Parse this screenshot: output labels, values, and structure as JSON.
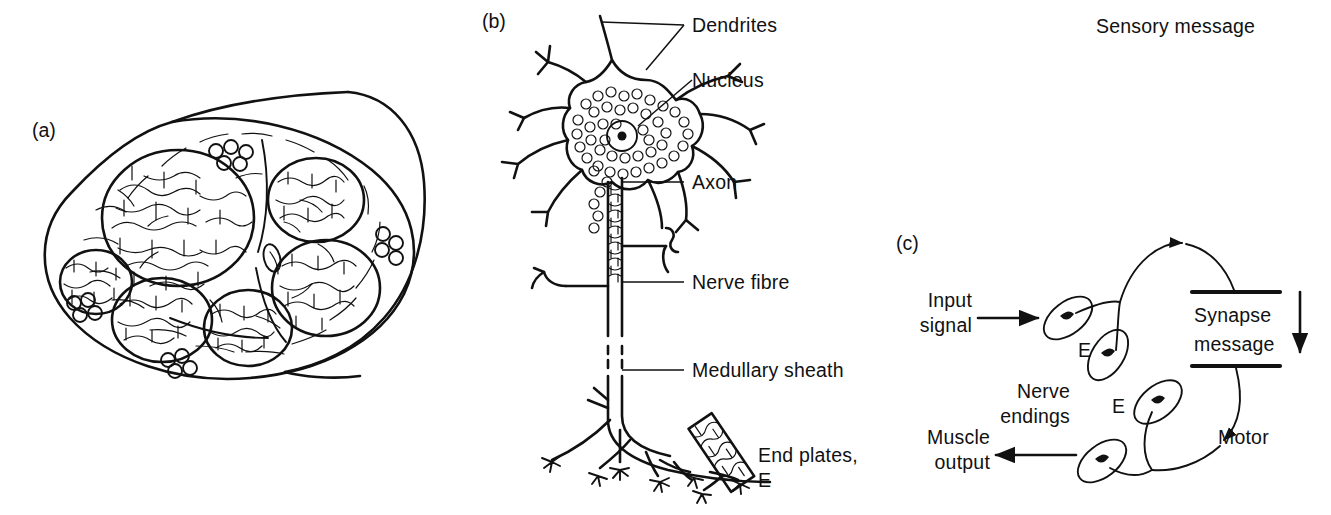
{
  "figure": {
    "background_color": "#ffffff",
    "ink_color": "#111111",
    "width": 1331,
    "height": 515
  },
  "panel_a": {
    "tag": "(a)",
    "description": "Cross-section of a peripheral nerve trunk showing fascicles",
    "fascicle_count": 6,
    "fat_cell_cluster_count": 4
  },
  "panel_b": {
    "tag": "(b)",
    "description": "Structure of a motor neuron",
    "labels": [
      {
        "name": "dendrites",
        "text": "Dendrites"
      },
      {
        "name": "nucleus",
        "text": "Nucleus"
      },
      {
        "name": "axon",
        "text": "Axon"
      },
      {
        "name": "nerve-fibre",
        "text": "Nerve fibre"
      },
      {
        "name": "medullary-sheath",
        "text": "Medullary sheath"
      },
      {
        "name": "end-plates-line1",
        "text": "End plates,"
      },
      {
        "name": "end-plates-line2",
        "text": "E"
      }
    ]
  },
  "panel_c": {
    "tag": "(c)",
    "description": "Signal flow loop from input signal through synapse to muscle output",
    "labels": {
      "input_signal_line1": "Input",
      "input_signal_line2": "signal",
      "sensory_message": "Sensory message",
      "synapse_line1": "Synapse",
      "synapse_line2": "message",
      "motor": "Motor",
      "nerve_endings_line1": "Nerve",
      "nerve_endings_line2": "endings",
      "muscle_output_line1": "Muscle",
      "muscle_output_line2": "output",
      "end_plate_upper": "E",
      "end_plate_lower": "E"
    },
    "flow": [
      "Input signal",
      "Nerve endings (E)",
      "Sensory message",
      "Synapse message",
      "Motor",
      "Nerve endings (E)",
      "Muscle output"
    ],
    "end_plate_count": 4
  }
}
